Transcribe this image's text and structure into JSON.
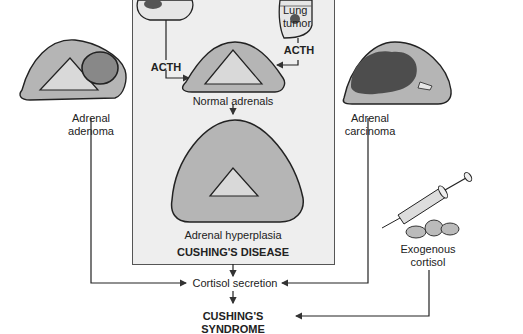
{
  "diagram": {
    "labels": {
      "lung_tumor": "Lung tumor",
      "acth_left": "ACTH",
      "acth_right": "ACTH",
      "normal_adrenals": "Normal adrenals",
      "adrenal_hyperplasia": "Adrenal hyperplasia",
      "cushings_disease": "CUSHING'S DISEASE",
      "adrenal_adenoma": "Adrenal adenoma",
      "adrenal_carcinoma": "Adrenal carcinoma",
      "exogenous_cortisol": "Exogenous cortisol",
      "cortisol_secretion": "Cortisol secretion",
      "cushings_syndrome": "CUSHING'S SYNDROME"
    },
    "colors": {
      "adrenal_fill": "#b5b5b5",
      "medulla_fill": "#d9d9d9",
      "tumor_dark": "#555555",
      "panel_bg": "#eeeeee",
      "line": "#333333"
    }
  }
}
